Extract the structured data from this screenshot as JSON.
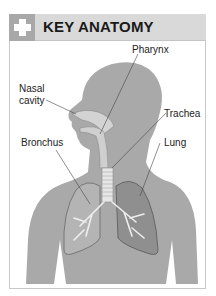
{
  "header": {
    "title": "KEY ANATOMY",
    "icon": "plus-cross-icon",
    "colors": {
      "bar": "#d9d9d9",
      "icon_box": "#a8a8a8",
      "icon_glyph": "#ffffff"
    }
  },
  "diagram": {
    "labels": {
      "pharynx": "Pharynx",
      "nasal_cavity_line1": "Nasal",
      "nasal_cavity_line2": "cavity",
      "trachea": "Trachea",
      "bronchus": "Bronchus",
      "lung": "Lung"
    }
  }
}
